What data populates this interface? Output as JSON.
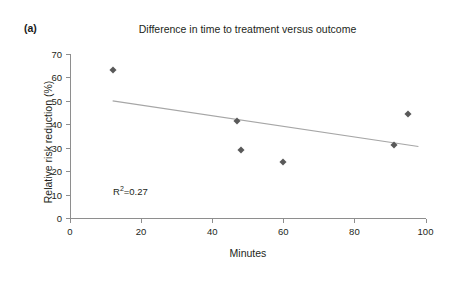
{
  "panel": {
    "label": "(a)"
  },
  "chart_data": {
    "type": "scatter",
    "title": "Difference in time to treatment versus outcome",
    "xlabel": "Minutes",
    "ylabel": "Relative risk reduction (%)",
    "xlim": [
      0,
      100
    ],
    "ylim": [
      0,
      70
    ],
    "xticks": [
      0,
      20,
      40,
      60,
      80,
      100
    ],
    "yticks": [
      0,
      10,
      20,
      30,
      40,
      50,
      60,
      70
    ],
    "xticklabels": [
      "0",
      "20",
      "40",
      "60",
      "80",
      "100"
    ],
    "yticklabels": [
      "0",
      "10",
      "20",
      "30",
      "40",
      "50",
      "60",
      "70"
    ],
    "grid": false,
    "legend": null,
    "marker_color": "#595959",
    "trendline_color": "#a6a6a6",
    "axis_color": "#8e8e8e",
    "points": [
      {
        "x": 12,
        "y": 63
      },
      {
        "x": 47,
        "y": 41.5
      },
      {
        "x": 48,
        "y": 29
      },
      {
        "x": 60,
        "y": 24
      },
      {
        "x": 91,
        "y": 31
      },
      {
        "x": 95,
        "y": 44.5
      }
    ],
    "trendline": {
      "x0": 12,
      "y0": 50,
      "x1": 98,
      "y1": 30.5
    },
    "annotations": [
      {
        "text_prefix": "R",
        "text_sup": "2",
        "text_suffix": "=0.27",
        "x": 12,
        "y": 15
      }
    ],
    "r_squared": 0.27
  }
}
